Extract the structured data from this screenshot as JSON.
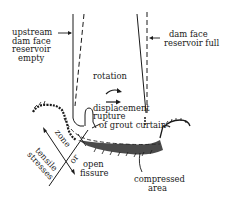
{
  "diagram": {
    "labels": {
      "upstream_empty": [
        "upstream",
        "dam face",
        "reservoir",
        "empty"
      ],
      "dam_face_full": [
        "dam face",
        "reservoir full"
      ],
      "rotation": "rotation",
      "displacement": "displacement",
      "rupture": [
        "rupture",
        "of grout curtain"
      ],
      "zone": "zone",
      "of": "or",
      "tensile": [
        "tensile",
        "stresses"
      ],
      "open_fissure": [
        "open",
        "fissure"
      ],
      "compressed": [
        "compressed",
        "area"
      ]
    },
    "colors": {
      "ink": "#1a1a1a",
      "background": "#ffffff"
    }
  }
}
